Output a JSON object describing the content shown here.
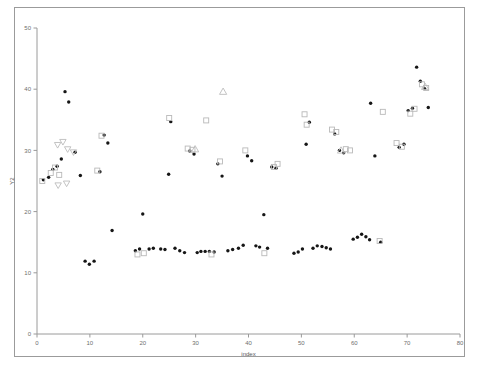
{
  "figure": {
    "background_color": "#ffffff",
    "frame_color": "#9b9b9b",
    "axis_color": "#9a9a9a"
  },
  "chart_data": {
    "type": "scatter",
    "title": "",
    "xlabel": "index",
    "ylabel": "Y2",
    "xlim": [
      0,
      80
    ],
    "ylim": [
      0,
      50
    ],
    "xticks": [
      0,
      10,
      20,
      30,
      40,
      50,
      60,
      70,
      80
    ],
    "xtick_labels": [
      "0",
      "10",
      "20",
      "30",
      "40",
      "50",
      "60",
      "70",
      "80"
    ],
    "yticks": [
      0,
      10,
      20,
      30,
      40,
      50
    ],
    "ytick_labels": [
      "0",
      "10",
      "20",
      "30",
      "40",
      "50"
    ],
    "grid": false,
    "legend": "none",
    "series": [
      {
        "name": "filled-circle",
        "marker": "circle",
        "color": "#161616",
        "points": [
          [
            1.2,
            25.2
          ],
          [
            2.2,
            25.6
          ],
          [
            3.0,
            26.9
          ],
          [
            3.8,
            27.4
          ],
          [
            4.6,
            28.6
          ],
          [
            5.3,
            39.6
          ],
          [
            6.0,
            37.9
          ],
          [
            7.2,
            29.7
          ],
          [
            8.2,
            25.9
          ],
          [
            9.1,
            11.9
          ],
          [
            9.9,
            11.4
          ],
          [
            10.8,
            11.9
          ],
          [
            11.9,
            26.5
          ],
          [
            12.7,
            32.5
          ],
          [
            13.4,
            31.2
          ],
          [
            14.2,
            16.9
          ],
          [
            18.6,
            13.6
          ],
          [
            19.4,
            13.9
          ],
          [
            20.0,
            19.6
          ],
          [
            21.2,
            13.9
          ],
          [
            22.0,
            14.0
          ],
          [
            23.4,
            13.9
          ],
          [
            24.2,
            13.8
          ],
          [
            24.9,
            26.1
          ],
          [
            25.3,
            34.7
          ],
          [
            26.1,
            14.0
          ],
          [
            27.0,
            13.6
          ],
          [
            27.9,
            13.3
          ],
          [
            28.9,
            29.9
          ],
          [
            29.7,
            29.4
          ],
          [
            30.3,
            13.3
          ],
          [
            31.0,
            13.5
          ],
          [
            31.8,
            13.5
          ],
          [
            32.6,
            13.5
          ],
          [
            33.5,
            13.4
          ],
          [
            34.2,
            27.8
          ],
          [
            35.0,
            25.8
          ],
          [
            36.1,
            13.6
          ],
          [
            37.0,
            13.8
          ],
          [
            38.1,
            14.0
          ],
          [
            39.0,
            14.5
          ],
          [
            39.8,
            29.1
          ],
          [
            40.6,
            28.3
          ],
          [
            41.4,
            14.4
          ],
          [
            42.1,
            14.2
          ],
          [
            42.9,
            19.5
          ],
          [
            43.6,
            14.0
          ],
          [
            44.4,
            27.3
          ],
          [
            45.2,
            27.1
          ],
          [
            48.6,
            13.2
          ],
          [
            49.4,
            13.4
          ],
          [
            50.2,
            13.9
          ],
          [
            50.9,
            31.0
          ],
          [
            51.5,
            34.6
          ],
          [
            52.2,
            14.0
          ],
          [
            53.0,
            14.4
          ],
          [
            53.9,
            14.3
          ],
          [
            54.7,
            14.1
          ],
          [
            55.5,
            13.9
          ],
          [
            56.3,
            32.7
          ],
          [
            57.2,
            30.0
          ],
          [
            58.0,
            29.6
          ],
          [
            59.8,
            15.5
          ],
          [
            60.6,
            15.8
          ],
          [
            61.4,
            16.3
          ],
          [
            62.2,
            15.9
          ],
          [
            62.9,
            15.4
          ],
          [
            63.1,
            37.7
          ],
          [
            63.9,
            29.1
          ],
          [
            65.0,
            15.0
          ],
          [
            68.5,
            30.5
          ],
          [
            69.4,
            31.0
          ],
          [
            70.2,
            36.5
          ],
          [
            71.0,
            36.9
          ],
          [
            71.8,
            43.6
          ],
          [
            72.5,
            41.3
          ],
          [
            73.3,
            40.1
          ],
          [
            74.0,
            37.0
          ]
        ]
      },
      {
        "name": "open-square",
        "marker": "square",
        "color": "#b9b9b9",
        "points": [
          [
            1.0,
            25.0
          ],
          [
            2.6,
            26.3
          ],
          [
            3.4,
            27.2
          ],
          [
            4.2,
            26.0
          ],
          [
            11.4,
            26.7
          ],
          [
            12.2,
            32.4
          ],
          [
            19.0,
            13.0
          ],
          [
            20.2,
            13.2
          ],
          [
            25.0,
            35.3
          ],
          [
            28.5,
            30.3
          ],
          [
            29.4,
            30.1
          ],
          [
            32.0,
            34.9
          ],
          [
            33.0,
            13.0
          ],
          [
            34.6,
            28.2
          ],
          [
            39.4,
            30.0
          ],
          [
            43.0,
            13.2
          ],
          [
            44.8,
            27.3
          ],
          [
            45.5,
            27.8
          ],
          [
            50.6,
            35.9
          ],
          [
            51.0,
            34.2
          ],
          [
            55.8,
            33.4
          ],
          [
            56.6,
            33.0
          ],
          [
            58.4,
            30.2
          ],
          [
            59.2,
            30.0
          ],
          [
            64.8,
            15.2
          ],
          [
            65.4,
            36.3
          ],
          [
            68.0,
            31.2
          ],
          [
            69.0,
            30.6
          ],
          [
            70.6,
            36.0
          ],
          [
            71.4,
            36.8
          ],
          [
            72.8,
            40.8
          ],
          [
            73.6,
            40.2
          ]
        ]
      },
      {
        "name": "open-triangle-up",
        "marker": "triangle-up",
        "color": "#bcbcbc",
        "points": [
          [
            29.9,
            30.2
          ],
          [
            35.2,
            39.6
          ],
          [
            57.5,
            30.0
          ],
          [
            73.4,
            40.4
          ]
        ]
      },
      {
        "name": "open-triangle-down",
        "marker": "triangle-down",
        "color": "#bcbcbc",
        "points": [
          [
            3.9,
            30.9
          ],
          [
            4.9,
            31.4
          ],
          [
            5.8,
            30.2
          ],
          [
            6.9,
            29.7
          ],
          [
            4.0,
            24.3
          ],
          [
            5.6,
            24.6
          ]
        ]
      }
    ]
  }
}
